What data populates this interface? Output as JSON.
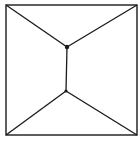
{
  "diagram": {
    "type": "graph",
    "stroke_color": "#1a1a1a",
    "background": "#ffffff",
    "outer_square": {
      "x": 6,
      "y": 5,
      "width": 131,
      "height": 130
    },
    "nodes": [
      {
        "id": "top-left",
        "x": 6,
        "y": 5
      },
      {
        "id": "top-right",
        "x": 137,
        "y": 5
      },
      {
        "id": "bottom-left",
        "x": 6,
        "y": 135
      },
      {
        "id": "bottom-right",
        "x": 137,
        "y": 135
      },
      {
        "id": "inner-upper",
        "x": 67,
        "y": 47
      },
      {
        "id": "inner-lower",
        "x": 66,
        "y": 91
      }
    ],
    "edges": [
      [
        "top-left",
        "inner-upper"
      ],
      [
        "top-right",
        "inner-upper"
      ],
      [
        "inner-upper",
        "inner-lower"
      ],
      [
        "inner-lower",
        "bottom-left"
      ],
      [
        "inner-lower",
        "bottom-right"
      ]
    ]
  }
}
